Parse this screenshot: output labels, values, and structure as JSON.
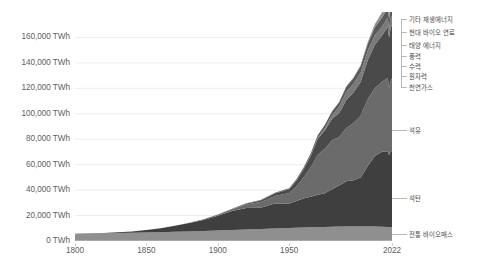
{
  "chart_data": {
    "type": "area",
    "title": "",
    "subtitle": "",
    "xlabel": "",
    "ylabel": "",
    "stacked": true,
    "grid": true,
    "legend_position": "right-inline",
    "xlim": [
      1800,
      2022
    ],
    "ylim": [
      0,
      180000
    ],
    "y_unit": "TWh",
    "y_ticks": [
      {
        "value": 0,
        "label": "0 TWh"
      },
      {
        "value": 20000,
        "label": "20,000 TWh"
      },
      {
        "value": 40000,
        "label": "40,000 TWh"
      },
      {
        "value": 60000,
        "label": "60,000 TWh"
      },
      {
        "value": 80000,
        "label": "80,000 TWh"
      },
      {
        "value": 100000,
        "label": "100,000 TWh"
      },
      {
        "value": 120000,
        "label": "120,000 TWh"
      },
      {
        "value": 140000,
        "label": "140,000 TWh"
      },
      {
        "value": 160000,
        "label": "160,000 TWh"
      }
    ],
    "x_ticks": [
      {
        "value": 1800,
        "label": "1800"
      },
      {
        "value": 1850,
        "label": "1850"
      },
      {
        "value": 1900,
        "label": "1900"
      },
      {
        "value": 1950,
        "label": "1950"
      },
      {
        "value": 2022,
        "label": "2022"
      }
    ],
    "x": [
      1800,
      1810,
      1820,
      1830,
      1840,
      1850,
      1860,
      1870,
      1880,
      1890,
      1900,
      1910,
      1920,
      1930,
      1940,
      1950,
      1955,
      1960,
      1965,
      1970,
      1975,
      1980,
      1985,
      1990,
      1995,
      2000,
      2005,
      2010,
      2015,
      2019,
      2020,
      2021,
      2022
    ],
    "series": [
      {
        "name": "전통 바이오매스",
        "color": "#8f8f8f",
        "values": [
          5600,
          5800,
          6000,
          6200,
          6400,
          6600,
          6900,
          7200,
          7500,
          7800,
          8200,
          8600,
          9000,
          9400,
          9800,
          10200,
          10400,
          10600,
          10800,
          11000,
          11100,
          11200,
          11300,
          11400,
          11400,
          11400,
          11400,
          11300,
          11200,
          11100,
          11000,
          11000,
          11000
        ]
      },
      {
        "name": "석탄",
        "color": "#3f3f3f",
        "values": [
          100,
          200,
          350,
          600,
          1100,
          2000,
          3200,
          4700,
          6600,
          8800,
          11700,
          14900,
          16900,
          16800,
          19600,
          19300,
          21000,
          22800,
          23900,
          25300,
          26500,
          29500,
          32400,
          35500,
          36300,
          38600,
          47600,
          55500,
          58900,
          59500,
          56500,
          59100,
          60000
        ]
      },
      {
        "name": "석유",
        "color": "#6b6b6b",
        "values": [
          0,
          0,
          0,
          0,
          0,
          0,
          10,
          60,
          180,
          400,
          800,
          1500,
          2800,
          4500,
          6000,
          8300,
          11500,
          16500,
          23000,
          31500,
          35000,
          38500,
          38000,
          42000,
          45000,
          48500,
          52500,
          53500,
          55000,
          57500,
          53000,
          55500,
          57000
        ]
      },
      {
        "name": "천연가스",
        "color": "#4a4a4a",
        "values": [
          0,
          0,
          0,
          0,
          0,
          0,
          0,
          0,
          10,
          40,
          100,
          250,
          600,
          1100,
          1900,
          2800,
          4300,
          6200,
          8900,
          12500,
          14500,
          16800,
          19000,
          22000,
          24000,
          26500,
          30500,
          34000,
          36500,
          40000,
          39500,
          41500,
          42000
        ]
      },
      {
        "name": "원자력",
        "color": "#7a7a7a",
        "values": [
          0,
          0,
          0,
          0,
          0,
          0,
          0,
          0,
          0,
          0,
          0,
          0,
          0,
          0,
          0,
          0,
          10,
          60,
          250,
          700,
          1700,
          2800,
          4800,
          6300,
          6900,
          7500,
          7600,
          7400,
          7000,
          7300,
          7100,
          7400,
          7300
        ]
      },
      {
        "name": "수력",
        "color": "#5a5a5a",
        "values": [
          0,
          0,
          0,
          0,
          0,
          0,
          0,
          0,
          5,
          25,
          80,
          180,
          320,
          480,
          680,
          900,
          1150,
          1450,
          1800,
          2200,
          2600,
          3000,
          3500,
          4000,
          4400,
          4800,
          5300,
          6300,
          7000,
          7400,
          7500,
          7300,
          7600
        ]
      },
      {
        "name": "풍력",
        "color": "#888888",
        "values": [
          0,
          0,
          0,
          0,
          0,
          0,
          0,
          0,
          0,
          0,
          0,
          0,
          0,
          0,
          0,
          0,
          0,
          0,
          0,
          0,
          0,
          0,
          5,
          10,
          25,
          70,
          160,
          600,
          1400,
          2500,
          2900,
          3400,
          3800
        ]
      },
      {
        "name": "태양 에너지",
        "color": "#6f6f6f",
        "values": [
          0,
          0,
          0,
          0,
          0,
          0,
          0,
          0,
          0,
          0,
          0,
          0,
          0,
          0,
          0,
          0,
          0,
          0,
          0,
          0,
          0,
          0,
          0,
          0,
          2,
          5,
          15,
          90,
          450,
          1000,
          1300,
          1700,
          2200
        ]
      },
      {
        "name": "현대 바이오 연료",
        "color": "#5f5f5f",
        "values": [
          0,
          0,
          0,
          0,
          0,
          0,
          0,
          0,
          0,
          0,
          0,
          0,
          0,
          0,
          0,
          0,
          0,
          0,
          0,
          0,
          0,
          20,
          60,
          130,
          220,
          330,
          600,
          900,
          1050,
          1150,
          1100,
          1180,
          1250
        ]
      },
      {
        "name": "기타 재생에너지",
        "color": "#7e7e7e",
        "values": [
          0,
          0,
          0,
          0,
          0,
          0,
          0,
          0,
          0,
          0,
          0,
          0,
          0,
          0,
          0,
          0,
          0,
          0,
          5,
          20,
          50,
          90,
          150,
          250,
          350,
          450,
          600,
          850,
          1150,
          1400,
          1450,
          1550,
          1650
        ]
      }
    ]
  },
  "legend": {
    "items": [
      {
        "label": "기타 재생에너지"
      },
      {
        "label": "현대 바이오 연료"
      },
      {
        "label": "태양 에너지"
      },
      {
        "label": "풍력"
      },
      {
        "label": "수력"
      },
      {
        "label": "원자력"
      },
      {
        "label": "천연가스"
      },
      {
        "label": "석유"
      },
      {
        "label": "석탄"
      },
      {
        "label": "전통 바이오매스"
      }
    ]
  }
}
